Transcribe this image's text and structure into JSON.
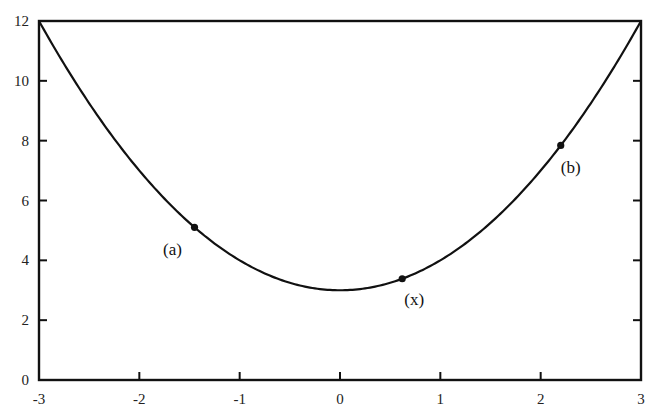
{
  "chart_data": {
    "type": "line",
    "title": "",
    "xlabel": "",
    "ylabel": "",
    "xlim": [
      -3,
      3
    ],
    "ylim": [
      0,
      12
    ],
    "grid": false,
    "legend": null,
    "x_ticks": [
      -3,
      -2,
      -1,
      0,
      1,
      2,
      3
    ],
    "y_ticks": [
      0,
      2,
      4,
      6,
      8,
      10,
      12
    ],
    "x_tick_labels": [
      "-3",
      "-2",
      "-1",
      "0",
      "1",
      "2",
      "3"
    ],
    "y_tick_labels": [
      "0",
      "2",
      "4",
      "6",
      "8",
      "10",
      "12"
    ],
    "series": [
      {
        "name": "curve",
        "function": "y = x^2 + 3",
        "x": [
          -3,
          -2.5,
          -2,
          -1.5,
          -1,
          -0.5,
          0,
          0.5,
          1,
          1.5,
          2,
          2.5,
          3
        ],
        "y": [
          12,
          9.25,
          7,
          5.25,
          4,
          3.25,
          3,
          3.25,
          4,
          5.25,
          7,
          9.25,
          12
        ],
        "color": "#111111"
      }
    ],
    "annotations": [
      {
        "label": "(a)",
        "x": -1.45,
        "y": 5.1
      },
      {
        "label": "(x)",
        "x": 0.62,
        "y": 3.38
      },
      {
        "label": "(b)",
        "x": 2.2,
        "y": 7.8
      }
    ]
  }
}
